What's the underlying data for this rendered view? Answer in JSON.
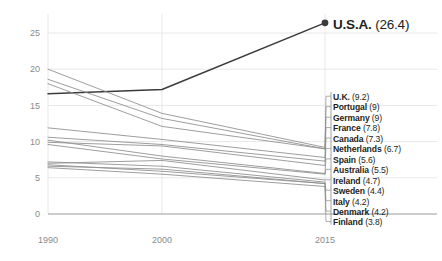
{
  "chart_data": {
    "type": "line",
    "title": "",
    "xlabel": "",
    "ylabel": "",
    "x": [
      1990,
      2000,
      2015
    ],
    "xtick_labels": [
      "1990",
      "2000",
      "2015"
    ],
    "ytick_labels": [
      "0",
      "5",
      "10",
      "15",
      "20",
      "25"
    ],
    "yticks": [
      0,
      5,
      10,
      15,
      20,
      25
    ],
    "ylim": [
      0,
      27.5
    ],
    "xlim": [
      1990,
      2015
    ],
    "grid": "vertical-and-horizontal-light",
    "legend_position": "right-outside",
    "highlight_series": "U.S.A.",
    "series": [
      {
        "name": "U.S.A.",
        "value_label": "26.4",
        "values": [
          16.6,
          17.2,
          26.4
        ],
        "highlight": true,
        "endpoint_marker": true
      },
      {
        "name": "U.K.",
        "value_label": "9.2",
        "values": [
          20.0,
          13.9,
          9.2
        ],
        "highlight": false,
        "endpoint_marker": false
      },
      {
        "name": "Portugal",
        "value_label": "9",
        "values": [
          18.6,
          13.2,
          9.0
        ],
        "highlight": false,
        "endpoint_marker": false
      },
      {
        "name": "Germany",
        "value_label": "9",
        "values": [
          18.0,
          12.1,
          9.0
        ],
        "highlight": false,
        "endpoint_marker": false
      },
      {
        "name": "France",
        "value_label": "7.8",
        "values": [
          11.9,
          10.3,
          7.8
        ],
        "highlight": false,
        "endpoint_marker": false
      },
      {
        "name": "Canada",
        "value_label": "7.3",
        "values": [
          10.6,
          9.6,
          7.3
        ],
        "highlight": false,
        "endpoint_marker": false
      },
      {
        "name": "Netherlands",
        "value_label": "6.7",
        "values": [
          9.9,
          9.4,
          6.7
        ],
        "highlight": false,
        "endpoint_marker": false
      },
      {
        "name": "Spain",
        "value_label": "5.6",
        "values": [
          10.2,
          8.0,
          5.6
        ],
        "highlight": false,
        "endpoint_marker": false
      },
      {
        "name": "Australia",
        "value_label": "5.5",
        "values": [
          9.6,
          7.6,
          5.5
        ],
        "highlight": false,
        "endpoint_marker": false
      },
      {
        "name": "Ireland",
        "value_label": "4.7",
        "values": [
          7.0,
          7.4,
          4.7
        ],
        "highlight": false,
        "endpoint_marker": false
      },
      {
        "name": "Sweden",
        "value_label": "4.4",
        "values": [
          7.2,
          6.6,
          4.4
        ],
        "highlight": false,
        "endpoint_marker": false
      },
      {
        "name": "Italy",
        "value_label": "4.2",
        "values": [
          6.6,
          6.2,
          4.2
        ],
        "highlight": false,
        "endpoint_marker": false
      },
      {
        "name": "Denmark",
        "value_label": "4.2",
        "values": [
          6.8,
          5.9,
          4.2
        ],
        "highlight": false,
        "endpoint_marker": false
      },
      {
        "name": "Finland",
        "value_label": "3.8",
        "values": [
          6.4,
          5.5,
          3.8
        ],
        "highlight": false,
        "endpoint_marker": false
      }
    ],
    "colors": {
      "highlight_line": "#3b3b3b",
      "line": "#8c8c8c",
      "axis": "#9a9a9a",
      "grid": "#e8e8e8",
      "text": "#231f20",
      "tick_text": "#8a8a8a",
      "background": "#ffffff"
    }
  },
  "legend": {
    "items": [
      {
        "name": "U.K.",
        "value": "(9.2)"
      },
      {
        "name": "Portugal",
        "value": "(9)"
      },
      {
        "name": "Germany",
        "value": "(9)"
      },
      {
        "name": "France",
        "value": "(7.8)"
      },
      {
        "name": "Canada",
        "value": "(7.3)"
      },
      {
        "name": "Netherlands",
        "value": "(6.7)"
      },
      {
        "name": "Spain",
        "value": "(5.6)"
      },
      {
        "name": "Australia",
        "value": "(5.5)"
      },
      {
        "name": "Ireland",
        "value": "(4.7)"
      },
      {
        "name": "Sweden",
        "value": "(4.4)"
      },
      {
        "name": "Italy",
        "value": "(4.2)"
      },
      {
        "name": "Denmark",
        "value": "(4.2)"
      },
      {
        "name": "Finland",
        "value": "(3.8)"
      }
    ]
  },
  "callout": {
    "name": "U.S.A.",
    "value": "(26.4)"
  }
}
